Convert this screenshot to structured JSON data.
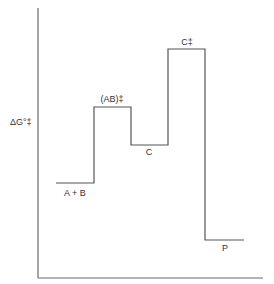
{
  "diagram": {
    "type": "free-energy-profile",
    "y_axis_label": "ΔG°‡",
    "colors": {
      "line": "#555555",
      "axis": "#6a6a6a",
      "text": "#333333"
    },
    "states": [
      {
        "label": "A + B",
        "position": "below",
        "y": 183,
        "x1": 56,
        "x2": 94
      },
      {
        "label": "(AB)‡",
        "position": "above",
        "y": 107,
        "x1": 94,
        "x2": 131
      },
      {
        "label": "C",
        "position": "below",
        "y": 145,
        "x1": 131,
        "x2": 168
      },
      {
        "label": "C‡",
        "position": "above",
        "y": 49,
        "x1": 168,
        "x2": 205
      },
      {
        "label": "P",
        "position": "below",
        "y": 240,
        "x1": 206,
        "x2": 244
      }
    ]
  }
}
